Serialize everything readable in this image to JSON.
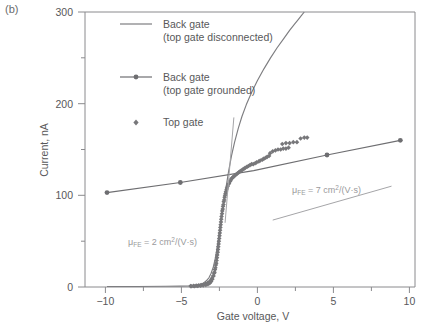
{
  "panel": {
    "label": "(b)"
  },
  "chart_data": {
    "type": "scatter",
    "title": "",
    "xlabel": "Gate voltage, V",
    "ylabel": "Current, nA",
    "xlim": [
      -11.5,
      11.0
    ],
    "ylim": [
      0,
      300
    ],
    "xticks": [
      -10,
      -5,
      0,
      5,
      10
    ],
    "xtick_labels": [
      "−10",
      "−5",
      "0",
      "5",
      "10"
    ],
    "yticks": [
      0,
      100,
      200,
      300
    ],
    "ytick_labels": [
      "0",
      "100",
      "200",
      "300"
    ],
    "yminorticks": [
      50,
      150,
      250
    ],
    "grid": false,
    "legend_position": "top-left-inside",
    "legend": [
      {
        "name": "back-gate-top-gate-disconnected",
        "label_line1": "Back gate",
        "label_line2": "(top gate disconnected)",
        "marker": "line",
        "color": "#7d7d80"
      },
      {
        "name": "back-gate-top-gate-grounded",
        "label_line1": "Back gate",
        "label_line2": "(top gate grounded)",
        "marker": "line-with-dot",
        "color": "#6e6e71"
      },
      {
        "name": "top-gate",
        "label_line1": "Top gate",
        "label_line2": "",
        "marker": "diamond",
        "color": "#77777a"
      }
    ],
    "series": [
      {
        "name": "Back gate (top gate disconnected)",
        "type": "line",
        "color": "#7d7d80",
        "points": [
          [
            -10,
            0.5
          ],
          [
            -8,
            0.6
          ],
          [
            -6,
            0.8
          ],
          [
            -5,
            1.0
          ],
          [
            -4.4,
            1.3
          ],
          [
            -4.0,
            1.8
          ],
          [
            -3.7,
            2.6
          ],
          [
            -3.45,
            4.0
          ],
          [
            -3.25,
            6.5
          ],
          [
            -3.05,
            10
          ],
          [
            -2.9,
            15
          ],
          [
            -2.75,
            22
          ],
          [
            -2.62,
            31
          ],
          [
            -2.5,
            42
          ],
          [
            -2.38,
            55
          ],
          [
            -2.26,
            68
          ],
          [
            -2.14,
            82
          ],
          [
            -2.0,
            97
          ],
          [
            -1.85,
            112
          ],
          [
            -1.7,
            127
          ],
          [
            -1.5,
            144
          ],
          [
            -1.3,
            158
          ],
          [
            -1.05,
            173
          ],
          [
            -0.8,
            186
          ],
          [
            -0.5,
            199
          ],
          [
            -0.15,
            212
          ],
          [
            0.25,
            225
          ],
          [
            0.7,
            238
          ],
          [
            1.15,
            250
          ],
          [
            1.6,
            261
          ],
          [
            2.05,
            271
          ],
          [
            2.45,
            280
          ],
          [
            2.8,
            287
          ],
          [
            3.05,
            292
          ],
          [
            3.25,
            296
          ],
          [
            3.45,
            300
          ]
        ]
      },
      {
        "name": "Back gate (top gate grounded)",
        "type": "line-with-markers",
        "color": "#6e6e71",
        "points": [
          [
            -10,
            103
          ],
          [
            -5,
            114
          ],
          [
            0,
            127
          ],
          [
            5,
            144
          ],
          [
            10,
            160
          ]
        ],
        "marker_points": [
          [
            -10,
            103
          ],
          [
            -5,
            114
          ],
          [
            5,
            144
          ],
          [
            10,
            160
          ]
        ]
      },
      {
        "name": "Top gate",
        "type": "scatter",
        "marker": "diamond",
        "color": "#77777a",
        "points": [
          [
            -4.3,
            1.0
          ],
          [
            -4.1,
            1.2
          ],
          [
            -3.92,
            1.5
          ],
          [
            -3.74,
            1.8
          ],
          [
            -3.58,
            2.2
          ],
          [
            -3.42,
            2.8
          ],
          [
            -3.28,
            3.5
          ],
          [
            -3.14,
            4.5
          ],
          [
            -3.02,
            5.8
          ],
          [
            -2.92,
            7.5
          ],
          [
            -2.84,
            9.5
          ],
          [
            -2.76,
            12
          ],
          [
            -2.7,
            15
          ],
          [
            -2.64,
            19
          ],
          [
            -2.58,
            24
          ],
          [
            -2.53,
            29
          ],
          [
            -2.48,
            35
          ],
          [
            -2.43,
            41
          ],
          [
            -2.39,
            47
          ],
          [
            -2.35,
            53
          ],
          [
            -2.31,
            59
          ],
          [
            -2.27,
            65
          ],
          [
            -2.23,
            71
          ],
          [
            -2.19,
            77
          ],
          [
            -2.14,
            83
          ],
          [
            -2.09,
            88
          ],
          [
            -2.04,
            93
          ],
          [
            -1.98,
            98
          ],
          [
            -1.92,
            102
          ],
          [
            -1.85,
            106
          ],
          [
            -1.77,
            110
          ],
          [
            -1.68,
            113
          ],
          [
            -1.58,
            116
          ],
          [
            -1.46,
            119
          ],
          [
            -1.33,
            121
          ],
          [
            -1.18,
            123
          ],
          [
            -1.02,
            125
          ],
          [
            -0.85,
            127
          ],
          [
            -0.66,
            129
          ],
          [
            -0.46,
            131
          ],
          [
            -0.25,
            133
          ],
          [
            -0.03,
            134
          ],
          [
            0.2,
            136
          ],
          [
            0.45,
            138
          ],
          [
            0.7,
            140
          ],
          [
            0.92,
            142
          ],
          [
            1.12,
            146
          ],
          [
            1.3,
            148
          ],
          [
            1.48,
            149
          ],
          [
            1.66,
            150
          ],
          [
            1.84,
            150
          ],
          [
            2.02,
            151
          ],
          [
            2.2,
            151
          ],
          [
            2.38,
            152
          ],
          [
            1.95,
            156
          ],
          [
            2.2,
            157
          ],
          [
            2.45,
            157
          ],
          [
            2.7,
            158
          ],
          [
            2.95,
            158
          ],
          [
            3.2,
            162
          ],
          [
            3.45,
            163
          ],
          [
            3.65,
            163
          ],
          [
            1.05,
            143
          ],
          [
            0.82,
            141
          ],
          [
            0.6,
            139
          ],
          [
            0.35,
            137
          ],
          [
            0.1,
            135
          ],
          [
            -0.14,
            134
          ],
          [
            -0.36,
            132
          ],
          [
            -0.58,
            130
          ],
          [
            -0.76,
            128
          ],
          [
            -0.94,
            126
          ],
          [
            -1.1,
            124
          ],
          [
            -1.26,
            122
          ],
          [
            -1.4,
            120
          ],
          [
            -1.52,
            118
          ],
          [
            -1.63,
            115
          ],
          [
            -1.73,
            112
          ],
          [
            -1.82,
            108
          ],
          [
            -1.89,
            104
          ],
          [
            -1.95,
            100
          ],
          [
            -2.01,
            95
          ],
          [
            -2.06,
            90
          ],
          [
            -2.11,
            85
          ],
          [
            -2.16,
            80
          ],
          [
            -2.21,
            74
          ],
          [
            -2.25,
            68
          ],
          [
            -2.29,
            62
          ],
          [
            -2.33,
            56
          ],
          [
            -2.37,
            50
          ],
          [
            -2.41,
            44
          ],
          [
            -2.45,
            38
          ],
          [
            -2.5,
            32
          ],
          [
            -2.55,
            26
          ],
          [
            -2.61,
            21
          ],
          [
            -2.67,
            16
          ],
          [
            -2.74,
            12
          ],
          [
            -2.82,
            8.5
          ],
          [
            -2.9,
            6.0
          ],
          [
            -3.0,
            4.2
          ],
          [
            -3.12,
            3.0
          ],
          [
            -3.26,
            2.2
          ],
          [
            -3.44,
            1.7
          ],
          [
            -3.62,
            1.4
          ],
          [
            -3.82,
            1.1
          ],
          [
            -4.02,
            0.9
          ],
          [
            -4.22,
            0.8
          ]
        ]
      }
    ],
    "annotations": [
      {
        "name": "mobility-top-gate",
        "text_prefix": "μ",
        "text_sub": "FE",
        "text_mid": " = 2 cm",
        "text_sup": "2",
        "text_suffix": "/(V·s)",
        "full_text": "μFE = 2 cm2/(V·s)",
        "value": 2,
        "units": "cm2/(V·s)",
        "tangent_line": {
          "x1": -1.95,
          "y1": 70,
          "x2": -1.35,
          "y2": 185
        }
      },
      {
        "name": "mobility-back-gate",
        "text_prefix": "μ",
        "text_sub": "FE",
        "text_mid": " = 7 cm",
        "text_sup": "2",
        "text_suffix": "/(V·s)",
        "full_text": "μFE = 7 cm2/(V·s)",
        "value": 7,
        "units": "cm2/(V·s)",
        "tangent_line": {
          "x1": 1.3,
          "y1": 73,
          "x2": 9.4,
          "y2": 110
        }
      }
    ]
  }
}
